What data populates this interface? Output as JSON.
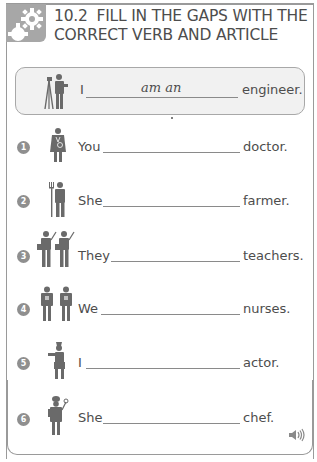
{
  "header": {
    "icon": "gears-icon",
    "number": "10.2",
    "title_line1": "FILL IN THE GAPS WITH THE",
    "title_line2": "CORRECT VERB AND ARTICLE"
  },
  "example": {
    "icon": "engineer-figure-icon",
    "subject": "I",
    "answer": "am an",
    "noun": "engineer."
  },
  "exercises": [
    {
      "number": "1",
      "icon": "doctor-figure-icon",
      "subject": "You",
      "answer": "",
      "noun": "doctor."
    },
    {
      "number": "2",
      "icon": "farmer-figure-icon",
      "subject": "She",
      "answer": "",
      "noun": "farmer."
    },
    {
      "number": "3",
      "icon": "teachers-figure-icon",
      "subject": "They",
      "answer": "",
      "noun": "teachers."
    },
    {
      "number": "4",
      "icon": "nurses-figure-icon",
      "subject": "We",
      "answer": "",
      "noun": "nurses."
    },
    {
      "number": "5",
      "icon": "actor-figure-icon",
      "subject": "I",
      "answer": "",
      "noun": "actor."
    },
    {
      "number": "6",
      "icon": "chef-figure-icon",
      "subject": "She",
      "answer": "",
      "noun": "chef."
    }
  ],
  "footer": {
    "audio_icon": "speaker-icon"
  },
  "colors": {
    "frame": "#9a9a9a",
    "header_box": "#a7a7a7",
    "example_bg": "#f1f1f1",
    "text": "#4d4d4d",
    "badge": "#8f8f8f"
  }
}
